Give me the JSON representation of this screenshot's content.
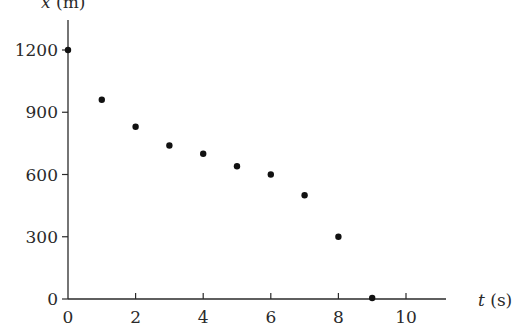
{
  "chart_data": {
    "type": "scatter",
    "title": "",
    "xlabel_var": "t",
    "xlabel_unit": "(s)",
    "ylabel_var": "x",
    "ylabel_unit": "(m)",
    "xlim": [
      0,
      11.3
    ],
    "ylim": [
      0,
      1200
    ],
    "x_ticks": [
      0,
      2,
      4,
      6,
      8,
      10
    ],
    "y_ticks": [
      0,
      300,
      600,
      900,
      1200
    ],
    "grid": false,
    "legend": null,
    "points": [
      {
        "t": 0,
        "x": 1200
      },
      {
        "t": 1,
        "x": 960
      },
      {
        "t": 2,
        "x": 830
      },
      {
        "t": 3,
        "x": 740
      },
      {
        "t": 4,
        "x": 700
      },
      {
        "t": 5,
        "x": 640
      },
      {
        "t": 6,
        "x": 600
      },
      {
        "t": 7,
        "x": 500
      },
      {
        "t": 8,
        "x": 300
      },
      {
        "t": 9,
        "x": 0
      }
    ],
    "colors": {
      "axis": "#2a2a2a",
      "marker": "#111111"
    }
  }
}
